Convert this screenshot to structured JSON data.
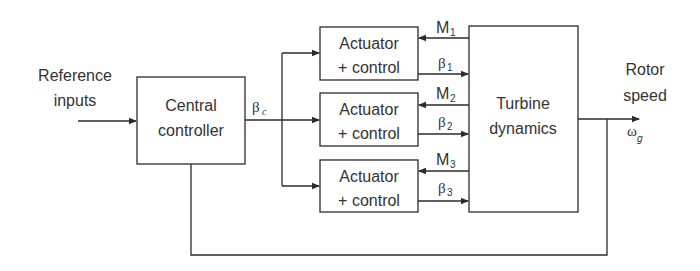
{
  "diagram": {
    "input": {
      "line1": "Reference",
      "line2": "inputs"
    },
    "central_controller": {
      "line1": "Central",
      "line2": "controller"
    },
    "controller_output": {
      "symbol": "β",
      "subscript": "c"
    },
    "actuators": [
      {
        "line1": "Actuator",
        "line2": "+ control",
        "moment": {
          "symbol": "M",
          "subscript": "1"
        },
        "pitch": {
          "symbol": "β",
          "subscript": "1"
        }
      },
      {
        "line1": "Actuator",
        "line2": "+ control",
        "moment": {
          "symbol": "M",
          "subscript": "2"
        },
        "pitch": {
          "symbol": "β",
          "subscript": "2"
        }
      },
      {
        "line1": "Actuator",
        "line2": "+ control",
        "moment": {
          "symbol": "M",
          "subscript": "3"
        },
        "pitch": {
          "symbol": "β",
          "subscript": "3"
        }
      }
    ],
    "turbine": {
      "line1": "Turbine",
      "line2": "dynamics"
    },
    "output": {
      "line1": "Rotor",
      "line2": "speed",
      "symbol": "ω",
      "subscript": "g"
    },
    "colors": {
      "line": "#2b2b2b",
      "text": "#333333",
      "background": "#ffffff"
    }
  }
}
